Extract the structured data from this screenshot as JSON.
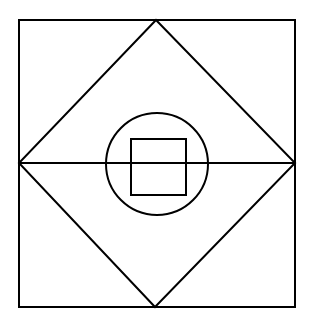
{
  "diagram": {
    "title": "",
    "stroke_color": "#000000",
    "background_color": "#ffffff",
    "shapes": [
      {
        "name": "outer-square",
        "type": "rect"
      },
      {
        "name": "inscribed-diamond",
        "type": "polygon",
        "vertices": [
          "top-midpoint",
          "right-midpoint",
          "bottom-midpoint",
          "left-midpoint"
        ]
      },
      {
        "name": "horizontal-diagonal",
        "type": "line",
        "from": "left-midpoint",
        "to": "right-midpoint"
      },
      {
        "name": "center-circle",
        "type": "circle"
      },
      {
        "name": "inner-square",
        "type": "rect"
      }
    ]
  }
}
